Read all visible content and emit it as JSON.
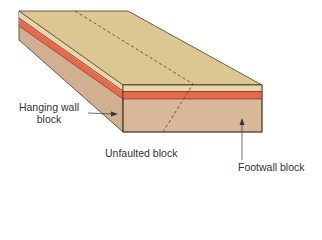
{
  "diagram": {
    "labels": {
      "hanging_wall_line1": "Hanging wall",
      "hanging_wall_line2": "block",
      "unfaulted": "Unfaulted block",
      "footwall": "Footwall block"
    },
    "colors": {
      "top_surface": "#dcc793",
      "top_layer": "#e7d6aa",
      "orange_layer": "#e9674a",
      "lower_layer": "#d8b898",
      "left_face": "#cfae8e",
      "outline": "#4a3a2a"
    }
  }
}
